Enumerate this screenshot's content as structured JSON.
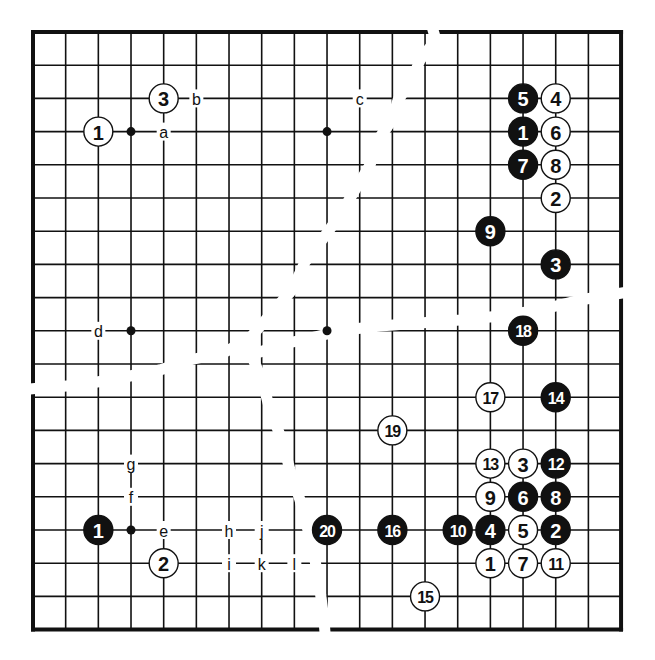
{
  "diagram": {
    "board": {
      "size": 19,
      "origin_x": 33,
      "origin_y": 32,
      "spacing_x": 32.67,
      "spacing_y": 33.2,
      "line_color": "#111111",
      "border_width": 4,
      "line_width": 1.6,
      "star_points": [
        [
          3,
          3
        ],
        [
          9,
          3
        ],
        [
          3,
          9
        ],
        [
          9,
          9
        ],
        [
          3,
          15
        ]
      ]
    },
    "colors": {
      "black_stone": "#111111",
      "white_stone": "#ffffff",
      "stone_outline": "#111111",
      "black_label": "#ffffff",
      "white_label": "#111111",
      "background": "#ffffff"
    },
    "panels": [
      {
        "name": "top-left",
        "stones": [
          {
            "col": 2,
            "row": 3,
            "color": "white",
            "label": "1"
          },
          {
            "col": 4,
            "row": 2,
            "color": "white",
            "label": "3"
          }
        ],
        "markers": [
          {
            "col": 4,
            "row": 3,
            "label": "a"
          },
          {
            "col": 5,
            "row": 2,
            "label": "b"
          },
          {
            "col": 10,
            "row": 2,
            "label": "c"
          },
          {
            "col": 2,
            "row": 9,
            "label": "d"
          }
        ]
      },
      {
        "name": "top-right",
        "stones": [
          {
            "col": 15,
            "row": 3,
            "color": "black",
            "label": "1"
          },
          {
            "col": 16,
            "row": 5,
            "color": "white",
            "label": "2"
          },
          {
            "col": 16,
            "row": 7,
            "color": "black",
            "label": "3"
          },
          {
            "col": 16,
            "row": 2,
            "color": "white",
            "label": "4"
          },
          {
            "col": 15,
            "row": 2,
            "color": "black",
            "label": "5"
          },
          {
            "col": 16,
            "row": 3,
            "color": "white",
            "label": "6"
          },
          {
            "col": 15,
            "row": 4,
            "color": "black",
            "label": "7"
          },
          {
            "col": 16,
            "row": 4,
            "color": "white",
            "label": "8"
          },
          {
            "col": 14,
            "row": 6,
            "color": "black",
            "label": "9"
          }
        ],
        "markers": []
      },
      {
        "name": "bottom-left",
        "stones": [
          {
            "col": 2,
            "row": 15,
            "color": "black",
            "label": "1"
          },
          {
            "col": 4,
            "row": 16,
            "color": "white",
            "label": "2"
          }
        ],
        "markers": [
          {
            "col": 4,
            "row": 15,
            "label": "e"
          },
          {
            "col": 3,
            "row": 14,
            "label": "f"
          },
          {
            "col": 3,
            "row": 13,
            "label": "g"
          },
          {
            "col": 6,
            "row": 15,
            "label": "h"
          },
          {
            "col": 6,
            "row": 16,
            "label": "i"
          },
          {
            "col": 7,
            "row": 15,
            "label": "j"
          },
          {
            "col": 7,
            "row": 16,
            "label": "k"
          },
          {
            "col": 8,
            "row": 16,
            "label": "l"
          }
        ]
      },
      {
        "name": "bottom-right",
        "stones": [
          {
            "col": 14,
            "row": 16,
            "color": "white",
            "label": "1"
          },
          {
            "col": 16,
            "row": 15,
            "color": "black",
            "label": "2"
          },
          {
            "col": 15,
            "row": 13,
            "color": "white",
            "label": "3"
          },
          {
            "col": 14,
            "row": 15,
            "color": "black",
            "label": "4"
          },
          {
            "col": 15,
            "row": 15,
            "color": "white",
            "label": "5"
          },
          {
            "col": 15,
            "row": 14,
            "color": "black",
            "label": "6"
          },
          {
            "col": 15,
            "row": 16,
            "color": "white",
            "label": "7"
          },
          {
            "col": 16,
            "row": 14,
            "color": "black",
            "label": "8"
          },
          {
            "col": 14,
            "row": 14,
            "color": "white",
            "label": "9"
          },
          {
            "col": 13,
            "row": 15,
            "color": "black",
            "label": "10"
          },
          {
            "col": 16,
            "row": 16,
            "color": "white",
            "label": "11"
          },
          {
            "col": 16,
            "row": 13,
            "color": "black",
            "label": "12"
          },
          {
            "col": 14,
            "row": 13,
            "color": "white",
            "label": "13"
          },
          {
            "col": 16,
            "row": 11,
            "color": "black",
            "label": "14"
          },
          {
            "col": 12,
            "row": 17,
            "color": "white",
            "label": "15"
          },
          {
            "col": 11,
            "row": 15,
            "color": "black",
            "label": "16"
          },
          {
            "col": 14,
            "row": 11,
            "color": "white",
            "label": "17"
          },
          {
            "col": 15,
            "row": 9,
            "color": "black",
            "label": "18"
          },
          {
            "col": 11,
            "row": 12,
            "color": "white",
            "label": "19"
          },
          {
            "col": 9,
            "row": 15,
            "color": "black",
            "label": "20"
          }
        ],
        "markers": []
      }
    ],
    "tears": [
      [
        [
          430,
          20
        ],
        [
          436,
          40
        ],
        [
          420,
          60
        ],
        [
          412,
          80
        ],
        [
          398,
          100
        ],
        [
          392,
          120
        ],
        [
          378,
          140
        ],
        [
          370,
          165
        ],
        [
          355,
          190
        ],
        [
          340,
          215
        ],
        [
          322,
          240
        ],
        [
          305,
          262
        ],
        [
          292,
          290
        ],
        [
          270,
          315
        ],
        [
          250,
          338
        ],
        [
          225,
          352
        ],
        [
          190,
          360
        ],
        [
          160,
          370
        ],
        [
          120,
          378
        ],
        [
          80,
          385
        ],
        [
          40,
          388
        ],
        [
          20,
          390
        ]
      ],
      [
        [
          640,
          290
        ],
        [
          610,
          295
        ],
        [
          580,
          300
        ],
        [
          540,
          310
        ],
        [
          500,
          316
        ],
        [
          460,
          320
        ],
        [
          420,
          323
        ],
        [
          380,
          326
        ],
        [
          345,
          330
        ],
        [
          310,
          338
        ],
        [
          280,
          345
        ],
        [
          260,
          352
        ]
      ],
      [
        [
          250,
          352
        ],
        [
          262,
          380
        ],
        [
          270,
          410
        ],
        [
          282,
          440
        ],
        [
          290,
          470
        ],
        [
          300,
          500
        ],
        [
          308,
          530
        ],
        [
          315,
          560
        ],
        [
          320,
          590
        ],
        [
          324,
          620
        ],
        [
          326,
          645
        ]
      ]
    ]
  }
}
